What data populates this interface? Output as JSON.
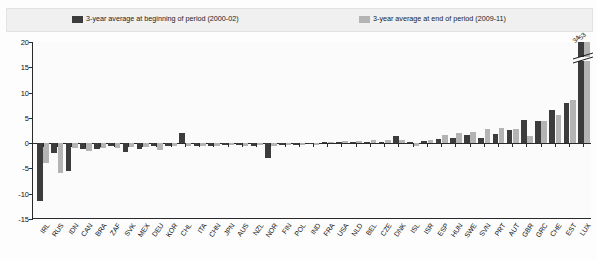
{
  "legend": {
    "items": [
      {
        "label": "3-year average at beginning of period (2000-02)",
        "color": "#3c3c3c",
        "name": "series-begin"
      },
      {
        "label": "3-year average at end of period (2009-11)",
        "color": "#b4b4b4",
        "name": "series-end"
      }
    ]
  },
  "axis": {
    "y_ticks": [
      "20",
      "15",
      "10",
      "5",
      "0",
      "-5",
      "-10",
      "-15"
    ]
  },
  "annotations": [
    {
      "text": "34",
      "series": "begin",
      "category": "LUX"
    },
    {
      "text": "53",
      "series": "end",
      "category": "LUX"
    }
  ],
  "chart_data": {
    "type": "bar",
    "title": "",
    "xlabel": "",
    "ylabel": "",
    "ylim": [
      -15,
      20
    ],
    "ytick_values": [
      20,
      15,
      10,
      5,
      0,
      -5,
      -10,
      -15
    ],
    "grid": false,
    "legend_position": "top",
    "categories": [
      "IRL",
      "RUS",
      "IDN",
      "CAN",
      "BRA",
      "ZAF",
      "SVK",
      "MEX",
      "DEU",
      "KOR",
      "CHL",
      "ITA",
      "CHN",
      "JPN",
      "AUS",
      "NZL",
      "NOR",
      "FIN",
      "POL",
      "IND",
      "FRA",
      "USA",
      "NLD",
      "BEL",
      "CZE",
      "DNK",
      "ISL",
      "ISR",
      "ESP",
      "HUN",
      "SWE",
      "SVN",
      "PRT",
      "AUT",
      "GBR",
      "GRC",
      "CHE",
      "EST",
      "LUX"
    ],
    "series": [
      {
        "name": "3-year average at beginning of period (2000-02)",
        "color": "#3c3c3c",
        "values": [
          -11.5,
          -2.0,
          -5.5,
          -1.2,
          -1.1,
          -0.6,
          -1.8,
          -1.2,
          -0.6,
          -0.6,
          2.0,
          -0.5,
          -0.6,
          -0.4,
          -0.4,
          -0.6,
          -3.0,
          -0.4,
          -0.3,
          -0.2,
          0.2,
          0.3,
          0.3,
          0.3,
          0.2,
          1.4,
          0.2,
          0.5,
          0.9,
          1.1,
          1.6,
          1.0,
          1.8,
          2.6,
          4.6,
          4.3,
          6.5,
          8.0,
          34.0
        ]
      },
      {
        "name": "3-year average at end of period (2009-11)",
        "color": "#b4b4b4",
        "values": [
          -4.0,
          -6.0,
          -1.0,
          -1.5,
          -0.9,
          -1.0,
          -0.8,
          -0.7,
          -1.3,
          -0.5,
          -0.5,
          -0.6,
          -0.5,
          -0.4,
          -0.5,
          -0.3,
          -0.5,
          -0.3,
          -0.4,
          -0.3,
          0.3,
          0.5,
          0.4,
          0.6,
          0.7,
          0.6,
          -0.5,
          0.7,
          1.7,
          2.1,
          2.2,
          2.7,
          2.9,
          2.8,
          1.4,
          4.4,
          5.5,
          8.6,
          53.0
        ]
      }
    ]
  }
}
